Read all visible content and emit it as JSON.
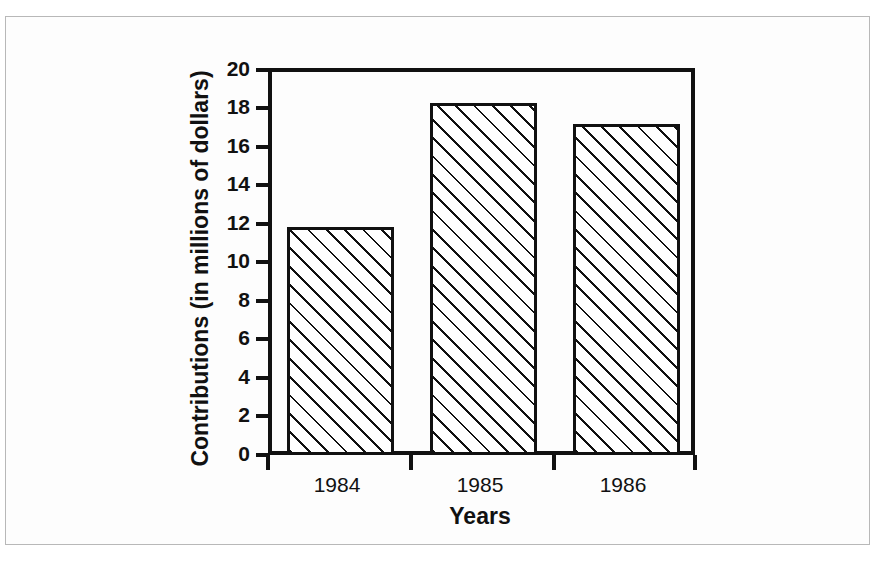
{
  "figure": {
    "background_color": "#fdfdfd",
    "page_border_color": "#b8b8b8",
    "ink_color": "#111111"
  },
  "chart_data": {
    "type": "bar",
    "title": "",
    "categories": [
      "1984",
      "1985",
      "1986"
    ],
    "values": [
      11.8,
      18.2,
      17.1
    ],
    "xlabel": "Years",
    "ylabel": "Contributions (in millions of dollars)",
    "ylim": [
      0,
      20
    ],
    "ytick_values": [
      0,
      2,
      4,
      6,
      8,
      10,
      12,
      14,
      16,
      18,
      20
    ],
    "ytick_labels": [
      "0",
      "2",
      "4",
      "6",
      "8",
      "10",
      "12",
      "14",
      "16",
      "18",
      "20"
    ],
    "ytick_step": 2,
    "grid": false,
    "legend": false,
    "legend_position": "none",
    "bar_fill": "diagonal-hatch",
    "bar_fill_angle_deg": 45,
    "bar_edge_color": "#111111",
    "series": [
      {
        "name": "Contributions",
        "values": [
          11.8,
          18.2,
          17.1
        ]
      }
    ]
  },
  "axis": {
    "y_title": "Contributions (in millions of dollars)",
    "x_title": "Years"
  }
}
